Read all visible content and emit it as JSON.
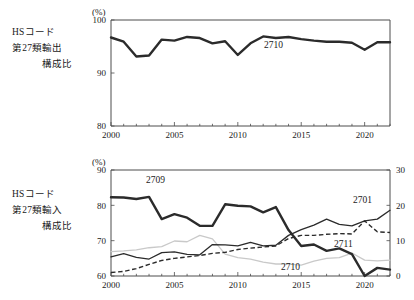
{
  "figure": {
    "title": "",
    "panels": [
      {
        "id": "top",
        "side_label": {
          "line1": "HSコード",
          "line2": "第27類輸出",
          "line3": "構成比"
        },
        "unit": "(%)",
        "y_ticks": [
          "80",
          "90",
          "100"
        ],
        "x_ticks": [
          "2000",
          "2005",
          "2010",
          "2015",
          "2020"
        ],
        "series_labels": {
          "s2710": "2710"
        }
      },
      {
        "id": "bottom",
        "side_label": {
          "line1": "HSコード",
          "line2": "第27類輸入",
          "line3": "構成比"
        },
        "unit": "(%)",
        "y_ticks": [
          "60",
          "70",
          "80",
          "90"
        ],
        "y2_ticks": [
          "0",
          "10",
          "20",
          "30"
        ],
        "x_ticks": [
          "2000",
          "2005",
          "2010",
          "2015",
          "2020"
        ],
        "series_labels": {
          "s2709": "2709",
          "s2701": "2701",
          "s2711": "2711",
          "s2710": "2710"
        }
      }
    ]
  },
  "chart_data": [
    {
      "type": "line",
      "id": "hs27-export-share",
      "title": "HSコード第27類輸出構成比",
      "xlabel": "",
      "ylabel": "(%)",
      "ylim": [
        80,
        100
      ],
      "xlim": [
        2000,
        2022
      ],
      "grid": false,
      "legend": "inline-annotation",
      "x": [
        2000,
        2001,
        2002,
        2003,
        2004,
        2005,
        2006,
        2007,
        2008,
        2009,
        2010,
        2011,
        2012,
        2013,
        2014,
        2015,
        2016,
        2017,
        2018,
        2019,
        2020,
        2021,
        2022
      ],
      "series": [
        {
          "name": "2710",
          "style": "thick-solid",
          "color": "#2b2b2b",
          "values": [
            96.7,
            95.9,
            93.1,
            93.3,
            96.3,
            96.1,
            96.8,
            96.6,
            95.6,
            96.0,
            93.4,
            95.6,
            96.9,
            96.6,
            96.8,
            96.4,
            96.1,
            95.9,
            95.9,
            95.7,
            94.4,
            95.8,
            95.8
          ]
        }
      ]
    },
    {
      "type": "line",
      "id": "hs27-import-share",
      "title": "HSコード第27類輸入構成比",
      "xlabel": "",
      "ylabel": "(%)",
      "ylim": [
        60,
        90
      ],
      "y2lim": [
        0,
        30
      ],
      "y2label": "",
      "xlim": [
        2000,
        2022
      ],
      "grid": false,
      "legend": "inline-annotation",
      "x": [
        2000,
        2001,
        2002,
        2003,
        2004,
        2005,
        2006,
        2007,
        2008,
        2009,
        2010,
        2011,
        2012,
        2013,
        2014,
        2015,
        2016,
        2017,
        2018,
        2019,
        2020,
        2021,
        2022
      ],
      "series": [
        {
          "name": "2709",
          "axis": "left",
          "style": "thick-solid",
          "color": "#2b2b2b",
          "values": [
            82.3,
            82.2,
            81.8,
            82.4,
            76.1,
            77.5,
            76.5,
            74.2,
            74.2,
            80.3,
            79.9,
            79.7,
            78.0,
            79.5,
            73.0,
            68.5,
            68.9,
            67.1,
            67.8,
            66.2,
            60.0,
            62.3,
            61.8
          ]
        },
        {
          "name": "2701",
          "axis": "left",
          "style": "thin-solid",
          "color": "#2b2b2b",
          "values": [
            65.4,
            66.3,
            65.3,
            64.8,
            66.6,
            66.8,
            66.1,
            66.0,
            68.9,
            68.8,
            68.5,
            69.5,
            68.5,
            68.7,
            71.5,
            73.1,
            74.4,
            76.1,
            74.6,
            74.2,
            75.6,
            76.1,
            78.6
          ]
        },
        {
          "name": "2711",
          "axis": "left",
          "style": "dashed",
          "color": "#2b2b2b",
          "values": [
            61.0,
            61.3,
            62.1,
            63.3,
            64.4,
            65.0,
            65.4,
            65.8,
            66.4,
            66.7,
            67.5,
            67.9,
            68.2,
            68.5,
            70.6,
            71.5,
            71.5,
            71.8,
            72.0,
            71.9,
            75.6,
            72.5,
            72.3
          ]
        },
        {
          "name": "2710",
          "axis": "left",
          "style": "light-solid",
          "color": "#c9c9c9",
          "values": [
            66.9,
            67.1,
            67.4,
            68.0,
            68.3,
            69.9,
            69.7,
            71.5,
            70.5,
            66.2,
            65.2,
            64.8,
            63.9,
            63.4,
            63.4,
            63.1,
            64.2,
            65.0,
            65.2,
            66.5,
            64.5,
            64.3,
            64.5
          ]
        }
      ]
    }
  ]
}
